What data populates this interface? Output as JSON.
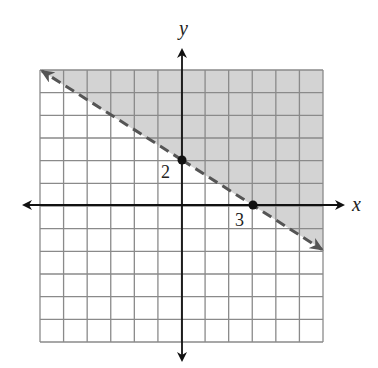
{
  "chart_data": {
    "type": "line",
    "title": "",
    "xlabel": "x",
    "ylabel": "y",
    "xlim": [
      -6,
      6
    ],
    "ylim": [
      -6,
      6
    ],
    "grid": true,
    "grid_step": 1,
    "boundary_line": {
      "style": "dashed",
      "slope": -0.6667,
      "y_intercept": 2,
      "x_intercept": 3,
      "points": [
        [
          -6,
          6
        ],
        [
          0,
          2
        ],
        [
          3,
          0
        ],
        [
          6,
          -2
        ]
      ],
      "arrows": "both"
    },
    "shaded_region": "above",
    "inequality": "y > -2/3 x + 2",
    "annotations": [
      {
        "text": "2",
        "point": [
          0,
          2
        ]
      },
      {
        "text": "3",
        "point": [
          3,
          0
        ]
      }
    ],
    "colors": {
      "shade": "#d3d3d3",
      "grid": "#8a8a8a",
      "axes": "#111111",
      "line": "#555555"
    }
  },
  "labels": {
    "x_axis": "x",
    "y_axis": "y",
    "y_intercept": "2",
    "x_intercept": "3"
  }
}
